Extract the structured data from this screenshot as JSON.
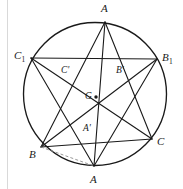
{
  "figure": {
    "background_color": "#ffffff",
    "stroke_color": "#1a1a1a",
    "dashed_stroke_color": "#8c8c8c",
    "circle": {
      "cx": 95,
      "cy": 94,
      "r": 71.5,
      "stroke_width": 1.35
    },
    "points": {
      "A_top": {
        "label": "A",
        "x": 105,
        "y": 22,
        "lx": 101,
        "ly": 3,
        "size": "major"
      },
      "A_bottom": {
        "label": "A",
        "x": 94,
        "y": 166,
        "lx": 90,
        "ly": 174,
        "size": "major"
      },
      "B": {
        "label": "B",
        "x": 41,
        "y": 147,
        "lx": 29,
        "ly": 149,
        "size": "major"
      },
      "C": {
        "label": "C",
        "x": 152,
        "y": 139,
        "lx": 157,
        "ly": 136,
        "size": "major"
      },
      "C1": {
        "label": "C",
        "sub": "1",
        "x": 31,
        "y": 58,
        "lx": 14,
        "ly": 50,
        "size": "major"
      },
      "B1": {
        "label": "B",
        "sub": "1",
        "x": 157,
        "y": 59,
        "lx": 162,
        "ly": 52,
        "size": "major"
      },
      "G": {
        "label": "G",
        "x": 96,
        "y": 97,
        "lx": 85,
        "ly": 92,
        "size": "minor"
      },
      "A_prime": {
        "label": "A'",
        "x": 94,
        "y": 127,
        "lx": 83,
        "ly": 124,
        "size": "minor"
      },
      "B_prime": {
        "label": "B'",
        "x": 124,
        "y": 78,
        "lx": 116,
        "ly": 66,
        "size": "minor"
      },
      "C_prime": {
        "label": "C'",
        "x": 68,
        "y": 76,
        "lx": 61,
        "ly": 66,
        "size": "minor"
      }
    },
    "solid_segments": [
      {
        "name": "segment-C1-B1",
        "from": "C1",
        "to": "B1"
      },
      {
        "name": "segment-B-C",
        "from": "B",
        "to": "C"
      },
      {
        "name": "segment-Atop-B",
        "from": "A_top",
        "to": "B"
      },
      {
        "name": "segment-Atop-C",
        "from": "A_top",
        "to": "C"
      },
      {
        "name": "segment-Atop-Abot",
        "from": "A_top",
        "to": "A_bottom"
      },
      {
        "name": "segment-Abot-C1",
        "from": "A_bottom",
        "to": "C1"
      },
      {
        "name": "segment-Abot-B1",
        "from": "A_bottom",
        "to": "B1"
      },
      {
        "name": "segment-C1-C",
        "from": "C1",
        "to": "C"
      },
      {
        "name": "segment-B1-B",
        "from": "B1",
        "to": "B"
      }
    ],
    "dashed_segments": [
      {
        "name": "segment-B-Abot-dashed",
        "from": "B",
        "to": "A_bottom"
      }
    ],
    "vertex_dots": [
      "G"
    ]
  }
}
